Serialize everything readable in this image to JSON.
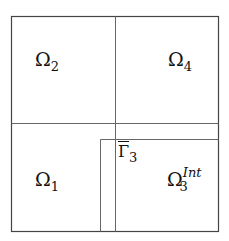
{
  "diagram": {
    "type": "domain-decomposition",
    "colors": {
      "line": "#555555",
      "border": "#444444",
      "background": "#ffffff"
    },
    "regions": [
      {
        "id": "omega1",
        "symbol": "Ω",
        "subscript": "1"
      },
      {
        "id": "omega2",
        "symbol": "Ω",
        "subscript": "2"
      },
      {
        "id": "omega3int",
        "symbol": "Ω",
        "subscript": "3",
        "superscript": "Int"
      },
      {
        "id": "omega4",
        "symbol": "Ω",
        "subscript": "4"
      }
    ],
    "interface": {
      "symbol": "Γ",
      "subscript": "3",
      "overline": true
    }
  }
}
